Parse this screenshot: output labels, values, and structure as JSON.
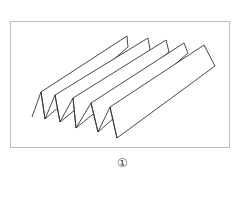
{
  "figure": {
    "caption": "①",
    "stroke_color": "#333333",
    "frame_color": "#bdbdbd",
    "strip_count": 5
  }
}
